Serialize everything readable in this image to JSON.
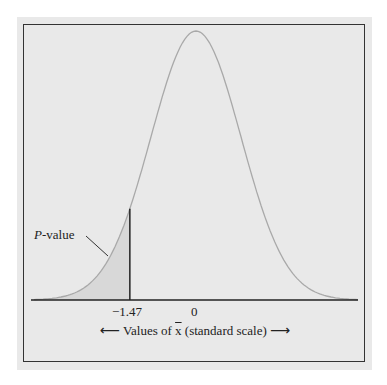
{
  "chart_data": {
    "type": "area",
    "title": "",
    "xlabel": "Values of x̄ (standard scale)",
    "ylabel": "",
    "tick_labels": [
      "−1.47",
      "0"
    ],
    "ticks": [
      -1.47,
      0
    ],
    "shaded_region": {
      "from": "-inf",
      "to": -1.47,
      "label": "P-value"
    },
    "distribution": {
      "mean": 0,
      "sd": 1
    },
    "grid": false,
    "legend": null
  },
  "labels": {
    "p_value_italic": "P",
    "p_value_rest": "-value",
    "tick_neg": "−1.47",
    "tick_zero": "0",
    "axis_pre": "Values of ",
    "axis_var": "x",
    "axis_post": " (standard scale)",
    "arrow_left": "⟵",
    "arrow_right": "⟶"
  },
  "colors": {
    "panel": "#e9e9e9",
    "curve": "#a8a8a8",
    "shade": "#d6d6d6",
    "line": "#222222"
  }
}
